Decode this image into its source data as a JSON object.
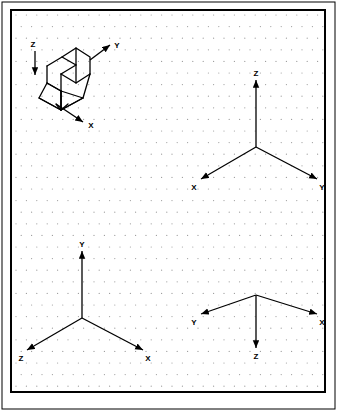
{
  "sheet": {
    "title": "Isometric axis orientations worksheet",
    "background_color": "#ffffff",
    "ink_color": "#000000",
    "grid_dot_color": "#9a9a9a",
    "outer_border": {
      "x": 2,
      "y": 2,
      "width": 333,
      "height": 407,
      "stroke_width": 1
    },
    "inner_border": {
      "x": 11,
      "y": 10,
      "width": 314,
      "height": 382,
      "stroke_width": 2
    },
    "grid": {
      "type": "isometric-dot-grid",
      "dot_spacing_x": 10.4,
      "dot_spacing_y": 11.6,
      "dot_radius": 0.6,
      "stagger": true
    }
  },
  "figures": [
    {
      "id": "isometric-object",
      "name": "notched-block-pictorial",
      "description": "Isometric pictorial of a block with a rectangular notch in the top face and chamfered side faces",
      "origin": {
        "x": 72,
        "y": 78
      },
      "axes": [
        {
          "label": "Z",
          "direction": "down",
          "label_x": 33,
          "label_y": 47,
          "tail_x": 35,
          "tail_y": 51,
          "tip_x": 35,
          "tip_y": 75
        },
        {
          "label": "Y",
          "direction": "up-right",
          "label_x": 117,
          "label_y": 48,
          "tail_x": 90,
          "tail_y": 60,
          "tip_x": 110,
          "tip_y": 45
        },
        {
          "label": "X",
          "direction": "down-right",
          "label_x": 91,
          "label_y": 128,
          "tail_x": 56,
          "tail_y": 104,
          "tip_x": 83,
          "tip_y": 122
        }
      ],
      "body_polylines": [
        "47,66 47,83 61,91 61,74",
        "47,66 62,57 76,65 76,48 90,57 90,74",
        "61,74 76,65",
        "61,74 76,83 90,74",
        "76,83 76,65",
        "62,57 76,48",
        "47,83 39,98 61,110 61,91",
        "61,110 83,98 90,74",
        "61,91 83,98",
        "61,110 61,91",
        "39,98 61,110 83,98",
        "47,83 61,91 61,110",
        "56,104 61,110 68,104"
      ]
    },
    {
      "id": "axes-top-right",
      "name": "axis-triad-z-up",
      "origin": {
        "x": 256,
        "y": 147
      },
      "axes": [
        {
          "label": "Z",
          "direction": "up",
          "label_x": 256,
          "label_y": 76,
          "tip_x": 256,
          "tip_y": 80
        },
        {
          "label": "X",
          "direction": "down-left",
          "label_x": 194,
          "label_y": 190,
          "tip_x": 201,
          "tip_y": 179
        },
        {
          "label": "Y",
          "direction": "down-right",
          "label_x": 322,
          "label_y": 190,
          "tip_x": 317,
          "tip_y": 179
        }
      ]
    },
    {
      "id": "axes-bottom-left",
      "name": "axis-triad-y-up",
      "origin": {
        "x": 82,
        "y": 318
      },
      "axes": [
        {
          "label": "Y",
          "direction": "up",
          "label_x": 82,
          "label_y": 247,
          "tip_x": 82,
          "tip_y": 251
        },
        {
          "label": "Z",
          "direction": "down-left",
          "label_x": 21,
          "label_y": 361,
          "tip_x": 27,
          "tip_y": 350
        },
        {
          "label": "X",
          "direction": "down-right",
          "label_x": 148,
          "label_y": 361,
          "tip_x": 143,
          "tip_y": 350
        }
      ]
    },
    {
      "id": "axes-bottom-right",
      "name": "axis-triad-z-down",
      "origin": {
        "x": 256,
        "y": 295
      },
      "axes": [
        {
          "label": "Z",
          "direction": "down",
          "label_x": 256,
          "label_y": 359,
          "tip_x": 256,
          "tip_y": 348
        },
        {
          "label": "Y",
          "direction": "up-left",
          "label_x": 194,
          "label_y": 325,
          "tip_x": 201,
          "tip_y": 314
        },
        {
          "label": "X",
          "direction": "up-right",
          "label_x": 322,
          "label_y": 325,
          "tip_x": 317,
          "tip_y": 314
        }
      ]
    }
  ]
}
